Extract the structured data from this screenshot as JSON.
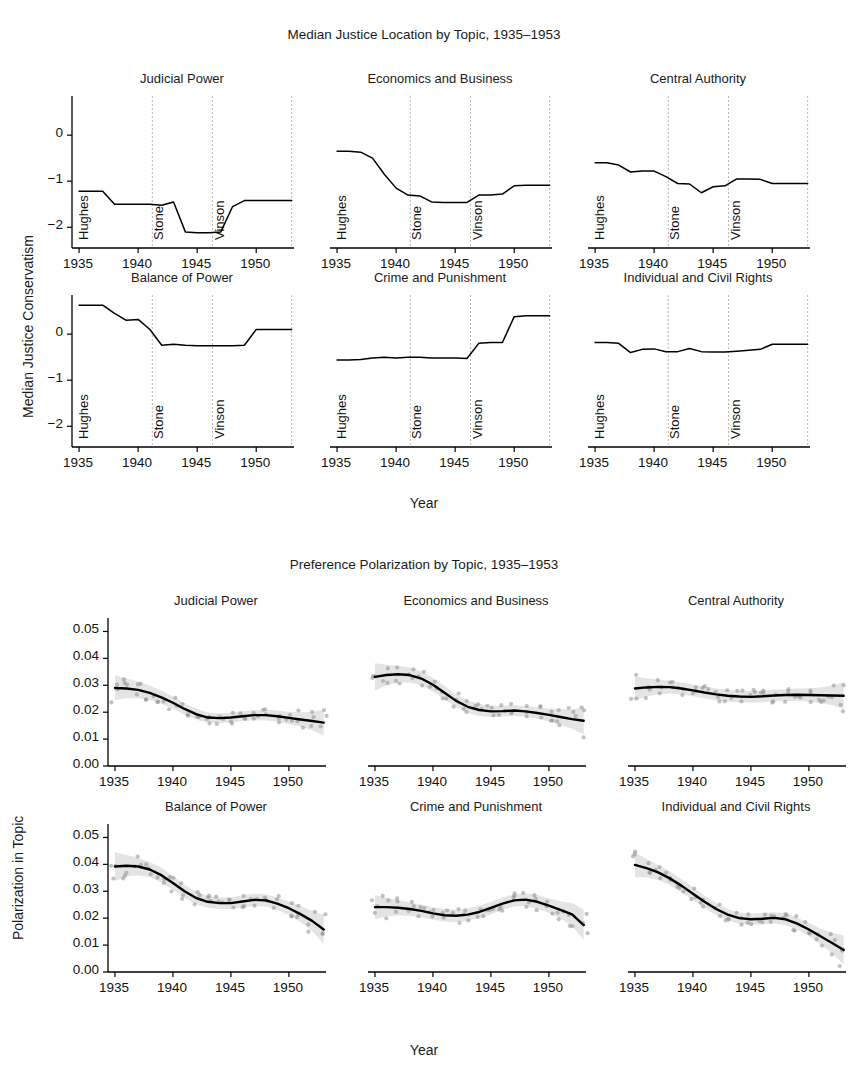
{
  "figure_top": {
    "title": "Median Justice Location by Topic, 1935–1953",
    "ylabel": "Median Justice Conservatism",
    "xlabel": "Year"
  },
  "figure_bottom": {
    "title": "Preference Polarization by Topic, 1935–1953",
    "ylabel": "Polarization in Topic",
    "xlabel": "Year"
  },
  "era_labels": [
    "Hughes",
    "Stone",
    "Vinson"
  ],
  "chart_data": [
    {
      "type": "line",
      "title": "Median Justice Location by Topic, 1935–1953",
      "xlabel": "Year",
      "ylabel": "Median Justice Conservatism",
      "xlim": [
        1934.4,
        1953.2
      ],
      "ylim": [
        -2.45,
        0.85
      ],
      "xticks": [
        1935,
        1940,
        1945,
        1950
      ],
      "yticks": [
        0,
        -1,
        -2
      ],
      "grid": false,
      "legend": "none",
      "era_boundaries": [
        1941.2,
        1946.3,
        1953.0
      ],
      "era_labels": [
        "Hughes",
        "Stone",
        "Vinson"
      ],
      "panels": [
        {
          "title": "Judicial Power",
          "x": [
            1935,
            1936,
            1937,
            1938,
            1939,
            1940,
            1941,
            1942,
            1943,
            1944,
            1945,
            1946,
            1947,
            1948,
            1949,
            1950,
            1951,
            1952,
            1953
          ],
          "values": [
            -1.22,
            -1.22,
            -1.22,
            -1.5,
            -1.5,
            -1.5,
            -1.5,
            -1.52,
            -1.45,
            -2.1,
            -2.12,
            -2.12,
            -2.1,
            -1.55,
            -1.42,
            -1.42,
            -1.42,
            -1.42,
            -1.42
          ]
        },
        {
          "title": "Economics and Business",
          "x": [
            1935,
            1936,
            1937,
            1938,
            1939,
            1940,
            1941,
            1942,
            1943,
            1944,
            1945,
            1946,
            1947,
            1948,
            1949,
            1950,
            1951,
            1952,
            1953
          ],
          "values": [
            -0.35,
            -0.35,
            -0.37,
            -0.5,
            -0.85,
            -1.15,
            -1.3,
            -1.32,
            -1.45,
            -1.46,
            -1.46,
            -1.46,
            -1.3,
            -1.3,
            -1.28,
            -1.1,
            -1.09,
            -1.09,
            -1.09
          ]
        },
        {
          "title": "Central Authority",
          "x": [
            1935,
            1936,
            1937,
            1938,
            1939,
            1940,
            1941,
            1942,
            1943,
            1944,
            1945,
            1946,
            1947,
            1948,
            1949,
            1950,
            1951,
            1952,
            1953
          ],
          "values": [
            -0.6,
            -0.6,
            -0.65,
            -0.8,
            -0.78,
            -0.78,
            -0.9,
            -1.05,
            -1.06,
            -1.25,
            -1.12,
            -1.1,
            -0.95,
            -0.95,
            -0.96,
            -1.05,
            -1.05,
            -1.05,
            -1.05
          ]
        },
        {
          "title": "Balance of Power",
          "x": [
            1935,
            1936,
            1937,
            1938,
            1939,
            1940,
            1941,
            1942,
            1943,
            1944,
            1945,
            1946,
            1947,
            1948,
            1949,
            1950,
            1951,
            1952,
            1953
          ],
          "values": [
            0.63,
            0.63,
            0.63,
            0.45,
            0.3,
            0.32,
            0.1,
            -0.24,
            -0.22,
            -0.24,
            -0.25,
            -0.25,
            -0.25,
            -0.25,
            -0.24,
            0.1,
            0.1,
            0.1,
            0.1
          ]
        },
        {
          "title": "Crime and Punishment",
          "x": [
            1935,
            1936,
            1937,
            1938,
            1939,
            1940,
            1941,
            1942,
            1943,
            1944,
            1945,
            1946,
            1947,
            1948,
            1949,
            1950,
            1951,
            1952,
            1953
          ],
          "values": [
            -0.56,
            -0.56,
            -0.55,
            -0.52,
            -0.5,
            -0.52,
            -0.5,
            -0.5,
            -0.52,
            -0.52,
            -0.52,
            -0.53,
            -0.2,
            -0.18,
            -0.18,
            0.38,
            0.4,
            0.4,
            0.4
          ]
        },
        {
          "title": "Individual and Civil Rights",
          "x": [
            1935,
            1936,
            1937,
            1938,
            1939,
            1940,
            1941,
            1942,
            1943,
            1944,
            1945,
            1946,
            1947,
            1948,
            1949,
            1950,
            1951,
            1952,
            1953
          ],
          "values": [
            -0.18,
            -0.18,
            -0.2,
            -0.4,
            -0.33,
            -0.32,
            -0.38,
            -0.38,
            -0.31,
            -0.38,
            -0.39,
            -0.39,
            -0.37,
            -0.35,
            -0.33,
            -0.22,
            -0.22,
            -0.22,
            -0.22
          ]
        }
      ]
    },
    {
      "type": "line",
      "title": "Preference Polarization by Topic, 1935–1953",
      "xlabel": "Year",
      "ylabel": "Polarization in Topic",
      "xlim": [
        1934.4,
        1953.2
      ],
      "ylim": [
        0.0,
        0.055
      ],
      "xticks": [
        1935,
        1940,
        1945,
        1950
      ],
      "yticks": [
        0.0,
        0.01,
        0.02,
        0.03,
        0.04,
        0.05
      ],
      "ytick_labels": [
        "0.00",
        "0.01",
        "0.02",
        "0.03",
        "0.04",
        "0.05"
      ],
      "grid": false,
      "legend": "none",
      "has_confidence_band": true,
      "has_scatter_points": true,
      "panels": [
        {
          "title": "Judicial Power",
          "x": [
            1935,
            1936,
            1937,
            1938,
            1939,
            1940,
            1941,
            1942,
            1943,
            1944,
            1945,
            1946,
            1947,
            1948,
            1949,
            1950,
            1951,
            1952,
            1953
          ],
          "values": [
            0.029,
            0.0288,
            0.0283,
            0.0272,
            0.0255,
            0.0235,
            0.0212,
            0.0193,
            0.018,
            0.0178,
            0.018,
            0.0185,
            0.0189,
            0.0189,
            0.0185,
            0.0179,
            0.0173,
            0.0167,
            0.0161
          ],
          "ci_lower": [
            0.0245,
            0.0252,
            0.0252,
            0.0245,
            0.0231,
            0.0212,
            0.019,
            0.0172,
            0.0161,
            0.016,
            0.0162,
            0.0167,
            0.017,
            0.0169,
            0.0164,
            0.0156,
            0.0146,
            0.0133,
            0.0112
          ],
          "ci_upper": [
            0.0337,
            0.0325,
            0.0314,
            0.0299,
            0.028,
            0.0258,
            0.0234,
            0.0214,
            0.0199,
            0.0196,
            0.0198,
            0.0203,
            0.0208,
            0.0209,
            0.0206,
            0.0202,
            0.02,
            0.0201,
            0.021
          ]
        },
        {
          "title": "Economics and Business",
          "x": [
            1935,
            1936,
            1937,
            1938,
            1939,
            1940,
            1941,
            1942,
            1943,
            1944,
            1945,
            1946,
            1947,
            1948,
            1949,
            1950,
            1951,
            1952,
            1953
          ],
          "values": [
            0.0331,
            0.0338,
            0.0341,
            0.0338,
            0.0325,
            0.0302,
            0.0272,
            0.0242,
            0.022,
            0.0208,
            0.0203,
            0.0204,
            0.0206,
            0.0203,
            0.0197,
            0.019,
            0.0182,
            0.0174,
            0.0168
          ],
          "ci_lower": [
            0.028,
            0.03,
            0.0309,
            0.031,
            0.0299,
            0.0277,
            0.0247,
            0.0218,
            0.0197,
            0.0186,
            0.0182,
            0.0184,
            0.0186,
            0.0183,
            0.0176,
            0.0166,
            0.0153,
            0.0138,
            0.0118
          ],
          "ci_upper": [
            0.0382,
            0.0376,
            0.0373,
            0.0366,
            0.0351,
            0.0327,
            0.0297,
            0.0266,
            0.0243,
            0.023,
            0.0224,
            0.0224,
            0.0226,
            0.0223,
            0.0218,
            0.0214,
            0.0211,
            0.021,
            0.0218
          ]
        },
        {
          "title": "Central Authority",
          "x": [
            1935,
            1936,
            1937,
            1938,
            1939,
            1940,
            1941,
            1942,
            1943,
            1944,
            1945,
            1946,
            1947,
            1948,
            1949,
            1950,
            1951,
            1952,
            1953
          ],
          "values": [
            0.0288,
            0.0292,
            0.0294,
            0.0293,
            0.0288,
            0.0281,
            0.0273,
            0.0266,
            0.0261,
            0.0258,
            0.0257,
            0.0259,
            0.0262,
            0.0264,
            0.0265,
            0.0264,
            0.0263,
            0.0262,
            0.0261
          ],
          "ci_lower": [
            0.0243,
            0.0258,
            0.0266,
            0.0269,
            0.0266,
            0.0259,
            0.0251,
            0.0244,
            0.0239,
            0.0236,
            0.0235,
            0.0237,
            0.024,
            0.0242,
            0.0242,
            0.0239,
            0.0234,
            0.0226,
            0.0212
          ],
          "ci_upper": [
            0.0333,
            0.0326,
            0.0322,
            0.0317,
            0.031,
            0.0303,
            0.0295,
            0.0288,
            0.0283,
            0.028,
            0.0279,
            0.0281,
            0.0284,
            0.0286,
            0.0288,
            0.0289,
            0.0292,
            0.0298,
            0.031
          ]
        },
        {
          "title": "Balance of Power",
          "x": [
            1935,
            1936,
            1937,
            1938,
            1939,
            1940,
            1941,
            1942,
            1943,
            1944,
            1945,
            1946,
            1947,
            1948,
            1949,
            1950,
            1951,
            1952,
            1953
          ],
          "values": [
            0.0392,
            0.0395,
            0.0392,
            0.0381,
            0.036,
            0.0331,
            0.03,
            0.0275,
            0.0261,
            0.0256,
            0.0256,
            0.0262,
            0.0268,
            0.0266,
            0.0254,
            0.0237,
            0.0215,
            0.019,
            0.0158
          ],
          "ci_lower": [
            0.0338,
            0.0355,
            0.036,
            0.0353,
            0.0333,
            0.0305,
            0.0276,
            0.0252,
            0.0239,
            0.0234,
            0.0234,
            0.024,
            0.0245,
            0.0243,
            0.0231,
            0.0212,
            0.0186,
            0.0152,
            0.0104
          ],
          "ci_upper": [
            0.0446,
            0.0435,
            0.0424,
            0.0409,
            0.0387,
            0.0357,
            0.0324,
            0.0298,
            0.0283,
            0.0278,
            0.0278,
            0.0284,
            0.0291,
            0.0289,
            0.0277,
            0.0262,
            0.0244,
            0.0228,
            0.0212
          ]
        },
        {
          "title": "Crime and Punishment",
          "x": [
            1935,
            1936,
            1937,
            1938,
            1939,
            1940,
            1941,
            1942,
            1943,
            1944,
            1945,
            1946,
            1947,
            1948,
            1949,
            1950,
            1951,
            1952,
            1953
          ],
          "values": [
            0.0241,
            0.0241,
            0.0239,
            0.0234,
            0.0227,
            0.0218,
            0.0211,
            0.0209,
            0.0213,
            0.0223,
            0.0238,
            0.0254,
            0.0266,
            0.0269,
            0.0261,
            0.0247,
            0.0231,
            0.0214,
            0.0174
          ],
          "ci_lower": [
            0.0196,
            0.0207,
            0.0211,
            0.0209,
            0.0203,
            0.0195,
            0.0188,
            0.0186,
            0.019,
            0.02,
            0.0215,
            0.0231,
            0.0243,
            0.0245,
            0.0236,
            0.022,
            0.0199,
            0.0172,
            0.0118
          ],
          "ci_upper": [
            0.0286,
            0.0275,
            0.0267,
            0.0259,
            0.0251,
            0.0241,
            0.0234,
            0.0232,
            0.0236,
            0.0246,
            0.0261,
            0.0277,
            0.0289,
            0.0293,
            0.0286,
            0.0274,
            0.0263,
            0.0256,
            0.023
          ]
        },
        {
          "title": "Individual and Civil Rights",
          "x": [
            1935,
            1936,
            1937,
            1938,
            1939,
            1940,
            1941,
            1942,
            1943,
            1944,
            1945,
            1946,
            1947,
            1948,
            1949,
            1950,
            1951,
            1952,
            1953
          ],
          "values": [
            0.0398,
            0.0386,
            0.037,
            0.0348,
            0.0321,
            0.0291,
            0.0261,
            0.0234,
            0.0213,
            0.02,
            0.0196,
            0.0198,
            0.0201,
            0.0196,
            0.018,
            0.0158,
            0.0133,
            0.0108,
            0.0082
          ],
          "ci_lower": [
            0.0352,
            0.0352,
            0.0342,
            0.0322,
            0.0296,
            0.0267,
            0.0238,
            0.0212,
            0.0192,
            0.0179,
            0.0175,
            0.0177,
            0.018,
            0.0175,
            0.0158,
            0.0134,
            0.0104,
            0.007,
            0.0028
          ],
          "ci_upper": [
            0.0444,
            0.042,
            0.0398,
            0.0374,
            0.0346,
            0.0315,
            0.0284,
            0.0256,
            0.0234,
            0.0221,
            0.0217,
            0.0219,
            0.0222,
            0.0217,
            0.0202,
            0.0182,
            0.0162,
            0.0146,
            0.0136
          ]
        }
      ]
    }
  ]
}
